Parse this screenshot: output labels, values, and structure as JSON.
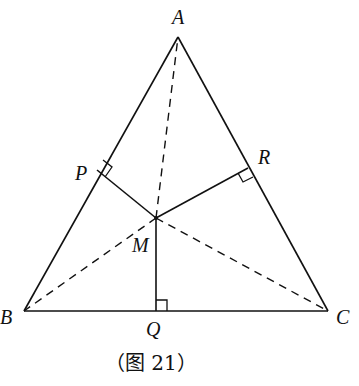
{
  "figure": {
    "caption": "（图 21）",
    "points": {
      "A": {
        "label": "A",
        "x": 178,
        "y": 37
      },
      "B": {
        "label": "B",
        "x": 24,
        "y": 311
      },
      "C": {
        "label": "C",
        "x": 328,
        "y": 311
      },
      "M": {
        "label": "M",
        "x": 156,
        "y": 218
      },
      "P": {
        "label": "P",
        "x": 97,
        "y": 170
      },
      "Q": {
        "label": "Q",
        "x": 156,
        "y": 311
      },
      "R": {
        "label": "R",
        "x": 248,
        "y": 168
      }
    },
    "solid_segments": [
      "AB",
      "AC",
      "BC",
      "MP",
      "MQ",
      "MR"
    ],
    "dashed_segments": [
      "MA",
      "MB",
      "MC"
    ],
    "right_angles": [
      "P",
      "Q",
      "R"
    ],
    "colors": {
      "stroke": "#111111",
      "background": "#ffffff"
    }
  }
}
